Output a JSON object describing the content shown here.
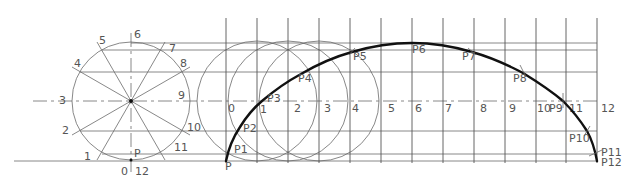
{
  "diagram": {
    "type": "cycloid-construction",
    "colors": {
      "construction": "#6a6a6a",
      "grid": "#555555",
      "curve": "#111111",
      "label": "#555555",
      "background": "#ffffff"
    },
    "generating_circle": {
      "center": [
        131,
        101
      ],
      "radius": 59,
      "division_labels": [
        "1",
        "2",
        "3",
        "4",
        "5",
        "6",
        "7",
        "8",
        "9",
        "10",
        "11"
      ],
      "contact_point_label": "P",
      "bottom_labels": {
        "left": "0",
        "right": "12"
      }
    },
    "locus_grid": {
      "x_start": 226,
      "spacing": 30.9,
      "count": 13,
      "top": 18,
      "bottom": 163,
      "center_line_labels": [
        "0",
        "1",
        "2",
        "3",
        "4",
        "5",
        "6",
        "7",
        "8",
        "9",
        "10",
        "11",
        "12"
      ]
    },
    "rolling_circles": {
      "center_indices": [
        1,
        2,
        3
      ],
      "radius": 60
    },
    "horizontal_levels": [
      {
        "y": 43,
        "label": "6"
      },
      {
        "y": 50,
        "label": "5/7"
      },
      {
        "y": 72,
        "label": "4/8"
      },
      {
        "y": 101,
        "label": "3/9 centre line"
      },
      {
        "y": 131,
        "label": "2/10"
      },
      {
        "y": 154,
        "label": "1/11"
      },
      {
        "y": 161,
        "label": "ground 0/12"
      }
    ],
    "curve_points": [
      {
        "label": "P",
        "x": 226,
        "y": 161
      },
      {
        "label": "P1",
        "x": 228,
        "y": 152
      },
      {
        "label": "P2",
        "x": 237,
        "y": 130
      },
      {
        "label": "P3",
        "x": 262,
        "y": 101
      },
      {
        "label": "P4",
        "x": 301,
        "y": 74
      },
      {
        "label": "P5",
        "x": 352,
        "y": 52
      },
      {
        "label": "P6",
        "x": 412,
        "y": 43
      },
      {
        "label": "P7",
        "x": 472,
        "y": 52
      },
      {
        "label": "P8",
        "x": 523,
        "y": 73
      },
      {
        "label": "P9",
        "x": 563,
        "y": 101
      },
      {
        "label": "P10",
        "x": 587,
        "y": 131
      },
      {
        "label": "P11",
        "x": 596,
        "y": 153
      },
      {
        "label": "P12",
        "x": 597,
        "y": 161
      }
    ]
  }
}
